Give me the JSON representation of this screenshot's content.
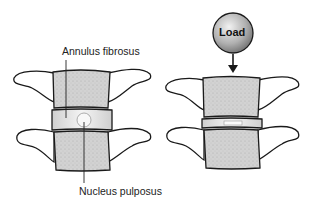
{
  "diagram": {
    "left_spine": {
      "state": "unloaded",
      "labels": {
        "annulus": "Annulus fibrosus",
        "nucleus": "Nucleus pulposus"
      }
    },
    "right_spine": {
      "state": "compressed",
      "load_label": "Load"
    },
    "colors": {
      "bone": "#d4d4d4",
      "outline": "#1a1a1a",
      "disc": "#e6e6e6",
      "load_ball": "#9a9a9a"
    }
  }
}
